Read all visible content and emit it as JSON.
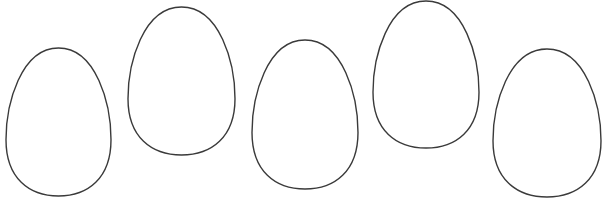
{
  "canvas": {
    "width": 605,
    "height": 204,
    "background": "#ffffff"
  },
  "stroke_color": "#3a3a3a",
  "eggs": [
    {
      "id": 1,
      "x": 6,
      "y": 48,
      "w": 105,
      "h": 148
    },
    {
      "id": 2,
      "x": 128,
      "y": 7,
      "w": 107,
      "h": 148
    },
    {
      "id": 3,
      "x": 252,
      "y": 40,
      "w": 106,
      "h": 149
    },
    {
      "id": 4,
      "x": 373,
      "y": 1,
      "w": 106,
      "h": 147
    },
    {
      "id": 5,
      "x": 493,
      "y": 49,
      "w": 108,
      "h": 148
    }
  ]
}
